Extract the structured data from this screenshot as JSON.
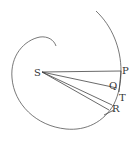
{
  "diagram": {
    "labels": {
      "S": "S",
      "P": "P",
      "Q": "Q",
      "T": "T",
      "R": "R"
    },
    "colors": {
      "stroke": "#555555",
      "text": "#333333",
      "background": "#ffffff"
    }
  }
}
